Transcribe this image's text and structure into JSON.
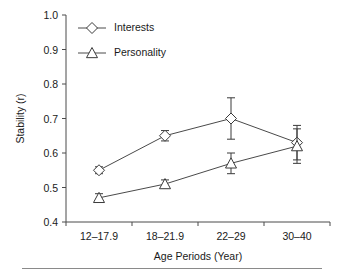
{
  "chart_data": {
    "type": "line",
    "title": "",
    "xlabel": "Age Periods (Year)",
    "ylabel": "Stability (r)",
    "categories": [
      "12–17.9",
      "18–21.9",
      "22–29",
      "30–40"
    ],
    "ylim": [
      0.4,
      1.0
    ],
    "ytick_labels": [
      "0.4",
      "0.5",
      "0.6",
      "0.7",
      "0.8",
      "0.9",
      "1.0"
    ],
    "yticks": [
      0.4,
      0.5,
      0.6,
      0.7,
      0.8,
      0.9,
      1.0
    ],
    "grid": false,
    "legend_position": "top-left",
    "series": [
      {
        "name": "Interests",
        "marker": "diamond",
        "values": [
          0.55,
          0.65,
          0.7,
          0.63
        ],
        "errors": [
          0.01,
          0.015,
          0.06,
          0.05
        ]
      },
      {
        "name": "Personality",
        "marker": "triangle",
        "values": [
          0.47,
          0.51,
          0.57,
          0.62
        ],
        "errors": [
          0.012,
          0.012,
          0.03,
          0.05
        ]
      }
    ]
  },
  "legend": {
    "entries": [
      {
        "label": "Interests",
        "marker": "diamond"
      },
      {
        "label": "Personality",
        "marker": "triangle"
      }
    ]
  },
  "axes": {
    "y_title": "Stability (r)",
    "x_title": "Age Periods (Year)"
  },
  "colors": {
    "axis": "#4a4a4a",
    "marker_stroke": "#3a3a3a",
    "marker_fill": "#ffffff",
    "text": "#1a1a1a",
    "rule": "#8a8a8a"
  }
}
